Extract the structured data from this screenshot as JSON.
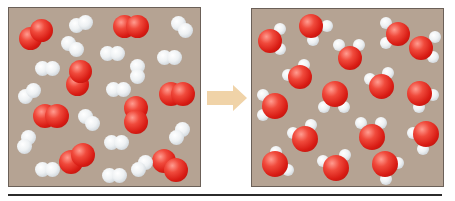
{
  "diagram": {
    "type": "reaction-before-after",
    "colors": {
      "background_box": "#b5a393",
      "box_border": "#6b6058",
      "oxygen_atom": "#d81c14",
      "hydrogen_atom": "#eef1f3",
      "arrow": "#f0d3a8",
      "divider": "#2b2b2b"
    },
    "left_panel": {
      "label": "reactants",
      "oxygen_molecules": 8,
      "hydrogen_molecules": 16
    },
    "arrow": {
      "direction": "right",
      "icon": "arrow-right-icon"
    },
    "right_panel": {
      "label": "products",
      "water_molecules": 16
    }
  }
}
